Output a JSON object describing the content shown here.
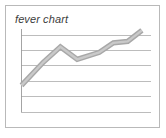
{
  "card": {
    "title": "fever chart",
    "border_color": "#b9b9b9",
    "background_color": "#ffffff"
  },
  "chart_data": {
    "type": "line",
    "title": "fever chart",
    "xlabel": "",
    "ylabel": "",
    "grid": true,
    "legend": false,
    "legend_position": "none",
    "axis_color": "#9a9a9a",
    "gridline_color": "#b5b5b5",
    "series_color": "#a8a8a8",
    "gridline_count": 6,
    "xlim": [
      0,
      10
    ],
    "ylim": [
      0,
      6
    ],
    "x": [
      0,
      1.7,
      3,
      4.3,
      6,
      7.1,
      8.2,
      9.3
    ],
    "values": [
      1.9,
      3.6,
      4.7,
      3.8,
      4.3,
      5.0,
      5.1,
      5.9
    ],
    "series": [
      {
        "name": "fever line",
        "values": [
          1.9,
          3.6,
          4.7,
          3.8,
          4.3,
          5.0,
          5.1,
          5.9
        ]
      }
    ],
    "categories": [
      "",
      "",
      "",
      "",
      "",
      "",
      "",
      ""
    ],
    "tick_labels_x": [],
    "tick_labels_y": [],
    "annotations": []
  }
}
